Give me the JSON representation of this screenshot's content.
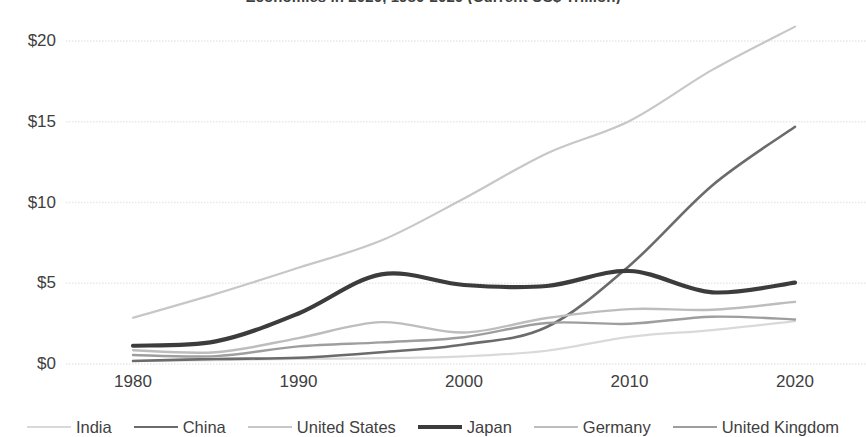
{
  "chart_data": {
    "type": "line",
    "title": "Economies in 2020, 1980-2020 (Current US$ Trillion)",
    "xlabel": "",
    "ylabel": "",
    "xlim": [
      1980,
      2020
    ],
    "ylim": [
      0,
      21.5
    ],
    "grid": true,
    "legend_position": "bottom",
    "x_ticks": [
      "1980",
      "1990",
      "2000",
      "2010",
      "2020"
    ],
    "x_tick_values": [
      1980,
      1990,
      2000,
      2010,
      2020
    ],
    "y_ticks": [
      "$0",
      "$5",
      "$10",
      "$15",
      "$20"
    ],
    "y_tick_values": [
      0,
      5,
      10,
      15,
      20
    ],
    "x": [
      1980,
      1985,
      1990,
      1995,
      2000,
      2005,
      2010,
      2015,
      2020
    ],
    "series": [
      {
        "name": "India",
        "color": "#d9d9d9",
        "width": 2.2,
        "values": [
          0.19,
          0.24,
          0.32,
          0.36,
          0.47,
          0.82,
          1.68,
          2.1,
          2.66
        ]
      },
      {
        "name": "China",
        "color": "#6b6b6b",
        "width": 2.6,
        "values": [
          0.19,
          0.31,
          0.39,
          0.73,
          1.21,
          2.29,
          6.09,
          11.06,
          14.69
        ]
      },
      {
        "name": "United States",
        "color": "#c7c7c7",
        "width": 2.2,
        "values": [
          2.86,
          4.34,
          5.96,
          7.64,
          10.25,
          13.04,
          15.05,
          18.21,
          20.89
        ]
      },
      {
        "name": "Japan",
        "color": "#3c3c3c",
        "width": 4.2,
        "values": [
          1.13,
          1.4,
          3.13,
          5.55,
          4.89,
          4.83,
          5.76,
          4.44,
          5.04
        ]
      },
      {
        "name": "Germany",
        "color": "#bdbdbd",
        "width": 2.4,
        "values": [
          0.85,
          0.73,
          1.6,
          2.59,
          1.95,
          2.85,
          3.4,
          3.36,
          3.85
        ]
      },
      {
        "name": "United Kingdom",
        "color": "#9e9e9e",
        "width": 2.4,
        "values": [
          0.56,
          0.49,
          1.09,
          1.34,
          1.66,
          2.54,
          2.49,
          2.93,
          2.76
        ]
      }
    ]
  },
  "legend": {
    "items": [
      {
        "label": "India"
      },
      {
        "label": "China"
      },
      {
        "label": "United States"
      },
      {
        "label": "Japan"
      },
      {
        "label": "Germany"
      },
      {
        "label": "United Kingdom"
      }
    ]
  },
  "colors": {
    "background": "#ffffff",
    "gridline": "#e8e8e8",
    "text": "#404040"
  }
}
